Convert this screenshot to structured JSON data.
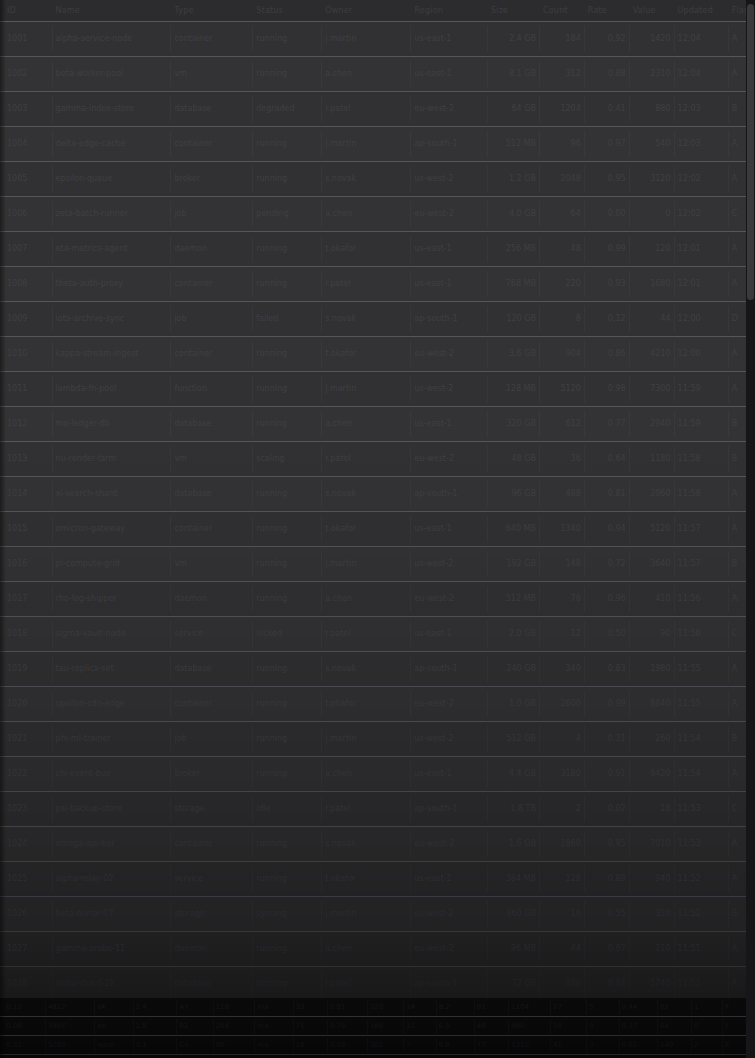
{
  "window": {
    "title": "Data Grid",
    "appearance": "dark-dimmed",
    "background_color": "#313133",
    "row_separator_color": "#55555a",
    "text_color": "#3f3f42",
    "dense_block_color": "#141416",
    "scrollbar_track_color": "#161618",
    "scrollbar_thumb_color": "#3a3a3d"
  },
  "header": {
    "columns": [
      "ID",
      "Name",
      "Type",
      "Status",
      "Owner",
      "Region",
      "Size",
      "Count",
      "Rate",
      "Value",
      "Updated",
      "Flag"
    ],
    "column_widths": [
      52,
      128,
      88,
      74,
      96,
      82,
      56,
      48,
      48,
      48,
      58,
      28
    ]
  },
  "grid": {
    "row_height": 35,
    "visible_rows": 28,
    "columns": [
      "ID",
      "Name",
      "Type",
      "Status",
      "Owner",
      "Region",
      "Size",
      "Count",
      "Rate",
      "Value",
      "Updated",
      "Flag"
    ],
    "rows": [
      [
        "1001",
        "alpha-service-node",
        "container",
        "running",
        "j.martin",
        "us-east-1",
        "2.4 GB",
        "184",
        "0.92",
        "1420",
        "12:04",
        "A"
      ],
      [
        "1002",
        "beta-worker-pool",
        "vm",
        "running",
        "a.chen",
        "us-east-1",
        "8.1 GB",
        "312",
        "0.88",
        "2310",
        "12:04",
        "A"
      ],
      [
        "1003",
        "gamma-index-store",
        "database",
        "degraded",
        "r.patel",
        "eu-west-2",
        "64 GB",
        "1204",
        "0.41",
        "880",
        "12:03",
        "B"
      ],
      [
        "1004",
        "delta-edge-cache",
        "container",
        "running",
        "j.martin",
        "ap-south-1",
        "512 MB",
        "96",
        "0.97",
        "540",
        "12:03",
        "A"
      ],
      [
        "1005",
        "epsilon-queue",
        "broker",
        "running",
        "s.novak",
        "us-west-2",
        "1.2 GB",
        "2048",
        "0.95",
        "3120",
        "12:02",
        "A"
      ],
      [
        "1006",
        "zeta-batch-runner",
        "job",
        "pending",
        "a.chen",
        "eu-west-2",
        "4.0 GB",
        "64",
        "0.00",
        "0",
        "12:02",
        "C"
      ],
      [
        "1007",
        "eta-metrics-agent",
        "daemon",
        "running",
        "t.okafor",
        "us-east-1",
        "256 MB",
        "48",
        "0.99",
        "120",
        "12:01",
        "A"
      ],
      [
        "1008",
        "theta-auth-proxy",
        "container",
        "running",
        "r.patel",
        "us-east-1",
        "768 MB",
        "220",
        "0.93",
        "1680",
        "12:01",
        "A"
      ],
      [
        "1009",
        "iota-archive-sync",
        "job",
        "failed",
        "s.novak",
        "ap-south-1",
        "120 GB",
        "8",
        "0.12",
        "44",
        "12:00",
        "D"
      ],
      [
        "1010",
        "kappa-stream-ingest",
        "container",
        "running",
        "t.okafor",
        "eu-west-2",
        "3.6 GB",
        "904",
        "0.86",
        "4210",
        "12:00",
        "A"
      ],
      [
        "1011",
        "lambda-fn-pool",
        "function",
        "running",
        "j.martin",
        "us-west-2",
        "128 MB",
        "5120",
        "0.98",
        "7300",
        "11:59",
        "A"
      ],
      [
        "1012",
        "mu-ledger-db",
        "database",
        "running",
        "a.chen",
        "us-east-1",
        "320 GB",
        "612",
        "0.77",
        "2940",
        "11:59",
        "B"
      ],
      [
        "1013",
        "nu-render-farm",
        "vm",
        "scaling",
        "r.patel",
        "eu-west-2",
        "48 GB",
        "36",
        "0.64",
        "1180",
        "11:58",
        "B"
      ],
      [
        "1014",
        "xi-search-shard",
        "database",
        "running",
        "s.novak",
        "ap-south-1",
        "96 GB",
        "488",
        "0.81",
        "2060",
        "11:58",
        "A"
      ],
      [
        "1015",
        "omicron-gateway",
        "container",
        "running",
        "t.okafor",
        "us-east-1",
        "640 MB",
        "1340",
        "0.94",
        "5120",
        "11:57",
        "A"
      ],
      [
        "1016",
        "pi-compute-grid",
        "vm",
        "running",
        "j.martin",
        "us-west-2",
        "192 GB",
        "148",
        "0.72",
        "3640",
        "11:57",
        "B"
      ],
      [
        "1017",
        "rho-log-shipper",
        "daemon",
        "running",
        "a.chen",
        "eu-west-2",
        "512 MB",
        "76",
        "0.96",
        "410",
        "11:56",
        "A"
      ],
      [
        "1018",
        "sigma-vault-node",
        "service",
        "locked",
        "r.patel",
        "us-east-1",
        "2.0 GB",
        "12",
        "0.50",
        "90",
        "11:56",
        "C"
      ],
      [
        "1019",
        "tau-replica-set",
        "database",
        "running",
        "s.novak",
        "ap-south-1",
        "240 GB",
        "340",
        "0.83",
        "1980",
        "11:55",
        "A"
      ],
      [
        "1020",
        "upsilon-cdn-edge",
        "container",
        "running",
        "t.okafor",
        "eu-west-2",
        "1.0 GB",
        "2600",
        "0.99",
        "8840",
        "11:55",
        "A"
      ],
      [
        "1021",
        "phi-ml-trainer",
        "job",
        "running",
        "j.martin",
        "us-west-2",
        "512 GB",
        "4",
        "0.31",
        "260",
        "11:54",
        "B"
      ],
      [
        "1022",
        "chi-event-bus",
        "broker",
        "running",
        "a.chen",
        "us-east-1",
        "4.4 GB",
        "3180",
        "0.91",
        "6420",
        "11:54",
        "A"
      ],
      [
        "1023",
        "psi-backup-store",
        "storage",
        "idle",
        "r.patel",
        "ap-south-1",
        "1.8 TB",
        "2",
        "0.02",
        "18",
        "11:53",
        "C"
      ],
      [
        "1024",
        "omega-api-tier",
        "container",
        "running",
        "s.novak",
        "eu-west-2",
        "1.6 GB",
        "1860",
        "0.95",
        "7010",
        "11:53",
        "A"
      ],
      [
        "1025",
        "alpha-relay-02",
        "service",
        "running",
        "t.okafor",
        "us-east-1",
        "384 MB",
        "128",
        "0.89",
        "940",
        "11:52",
        "A"
      ],
      [
        "1026",
        "beta-mirror-07",
        "storage",
        "syncing",
        "j.martin",
        "us-west-2",
        "860 GB",
        "16",
        "0.55",
        "320",
        "11:52",
        "B"
      ],
      [
        "1027",
        "gamma-probe-11",
        "daemon",
        "running",
        "a.chen",
        "eu-west-2",
        "96 MB",
        "44",
        "0.97",
        "210",
        "11:51",
        "A"
      ],
      [
        "1028",
        "delta-shard-19",
        "database",
        "running",
        "r.patel",
        "ap-south-1",
        "72 GB",
        "396",
        "0.84",
        "1740",
        "11:51",
        "A"
      ]
    ]
  },
  "dense_block": {
    "row_height": 19,
    "columns": [
      "c01",
      "c02",
      "c03",
      "c04",
      "c05",
      "c06",
      "c07",
      "c08",
      "c09",
      "c10",
      "c11",
      "c12",
      "c13",
      "c14",
      "c15",
      "c16",
      "c17",
      "c18",
      "c19",
      "c20"
    ],
    "column_widths": [
      44,
      52,
      40,
      46,
      38,
      44,
      40,
      36,
      42,
      38,
      34,
      40,
      36,
      44,
      38,
      34,
      40,
      36,
      32,
      34
    ],
    "rows": [
      [
        "0.12",
        "4812",
        "ok",
        "2.4",
        "A7",
        "118",
        "n/a",
        "33",
        "0.91",
        "220",
        "14",
        "8.2",
        "61",
        "1104",
        "27",
        "5",
        "0.44",
        "92",
        "1",
        "X"
      ],
      [
        "0.08",
        "3907",
        "ok",
        "1.9",
        "B2",
        "204",
        "n/a",
        "71",
        "0.76",
        "188",
        "22",
        "6.5",
        "48",
        "980",
        "19",
        "9",
        "0.37",
        "64",
        "0",
        "Y"
      ],
      [
        "0.31",
        "5260",
        "warn",
        "3.1",
        "C4",
        "96",
        "n/a",
        "18",
        "0.58",
        "301",
        "7",
        "9.8",
        "77",
        "1320",
        "41",
        "3",
        "0.62",
        "140",
        "2",
        "Z"
      ]
    ]
  },
  "scrollbar": {
    "orientation": "vertical",
    "thumb_position_pct": 0,
    "thumb_size_pct": 28
  }
}
